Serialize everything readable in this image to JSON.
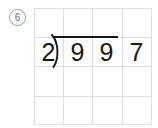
{
  "worksheet": {
    "problem_number": "6",
    "problem_number_style": "circled",
    "grid": {
      "columns": 4,
      "rows": 4,
      "cell_width": 29.5,
      "cell_height": 29.25,
      "line_color": "#dedede"
    },
    "division": {
      "type": "long-division",
      "divisor": "29",
      "dividend": "97",
      "divisor_digits": [
        "2",
        "9"
      ],
      "dividend_digits": [
        "9",
        "7"
      ],
      "bracket_glyph": ")",
      "has_vinculum": true,
      "quotient": "",
      "ink_color": "#171717"
    }
  },
  "colors": {
    "background": "#ffffff",
    "grid_line": "#dedede",
    "ink": "#171717",
    "marker": "#6e6e6e"
  }
}
